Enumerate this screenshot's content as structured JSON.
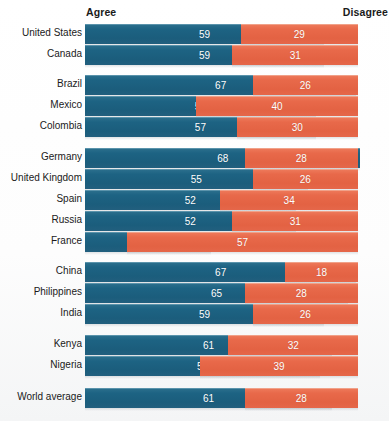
{
  "header": {
    "agree_label": "Agree",
    "disagree_label": "Disagree"
  },
  "colors": {
    "agree": "#1d6383",
    "disagree": "#e8694a",
    "background": "#ffffff",
    "label_text": "#1a1a1a",
    "value_text": "#ffffff"
  },
  "chart_data": {
    "type": "bar",
    "title": "",
    "subtitle": "",
    "xlabel": "",
    "ylabel": "",
    "orientation": "horizontal",
    "layout": "diverging-paired",
    "grid": false,
    "legend_position": "top",
    "xlim": [
      0,
      70
    ],
    "legend": [
      "Agree",
      "Disagree"
    ],
    "categories": [
      "United States",
      "Canada",
      "Brazil",
      "Mexico",
      "Colombia",
      "Germany",
      "United Kingdom",
      "Spain",
      "Russia",
      "France",
      "China",
      "Philippines",
      "India",
      "Kenya",
      "Nigeria",
      "World average"
    ],
    "series": [
      {
        "name": "Agree",
        "color": "#1d6383",
        "values": [
          59,
          59,
          67,
          57,
          57,
          68,
          55,
          52,
          52,
          31,
          67,
          65,
          59,
          61,
          58,
          61
        ]
      },
      {
        "name": "Disagree",
        "color": "#e8694a",
        "values": [
          29,
          31,
          26,
          40,
          30,
          28,
          26,
          34,
          31,
          57,
          18,
          28,
          26,
          32,
          39,
          28
        ]
      }
    ],
    "groups": [
      {
        "name": "North America",
        "rows": [
          "United States",
          "Canada"
        ]
      },
      {
        "name": "Latin America",
        "rows": [
          "Brazil",
          "Mexico",
          "Colombia"
        ]
      },
      {
        "name": "Europe",
        "rows": [
          "Germany",
          "United Kingdom",
          "Spain",
          "Russia",
          "France"
        ]
      },
      {
        "name": "Asia",
        "rows": [
          "China",
          "Philippines",
          "India"
        ]
      },
      {
        "name": "Africa",
        "rows": [
          "Kenya",
          "Nigeria"
        ]
      },
      {
        "name": "Overall",
        "rows": [
          "World average"
        ]
      }
    ]
  },
  "rows": [
    {
      "label": "United States",
      "agree": 59,
      "disagree": 29,
      "top": 24,
      "group": 0
    },
    {
      "label": "Canada",
      "agree": 59,
      "disagree": 31,
      "top": 45,
      "group": 0
    },
    {
      "label": "Brazil",
      "agree": 67,
      "disagree": 26,
      "top": 75,
      "group": 1
    },
    {
      "label": "Mexico",
      "agree": 57,
      "disagree": 40,
      "top": 96,
      "group": 1
    },
    {
      "label": "Colombia",
      "agree": 57,
      "disagree": 30,
      "top": 117,
      "group": 1
    },
    {
      "label": "Germany",
      "agree": 68,
      "disagree": 28,
      "top": 148,
      "group": 2
    },
    {
      "label": "United Kingdom",
      "agree": 55,
      "disagree": 26,
      "top": 169,
      "group": 2
    },
    {
      "label": "Spain",
      "agree": 52,
      "disagree": 34,
      "top": 190,
      "group": 2
    },
    {
      "label": "Russia",
      "agree": 52,
      "disagree": 31,
      "top": 211,
      "group": 2
    },
    {
      "label": "France",
      "agree": 31,
      "disagree": 57,
      "top": 232,
      "group": 2
    },
    {
      "label": "China",
      "agree": 67,
      "disagree": 18,
      "top": 262,
      "group": 3
    },
    {
      "label": "Philippines",
      "agree": 65,
      "disagree": 28,
      "top": 283,
      "group": 3
    },
    {
      "label": "India",
      "agree": 59,
      "disagree": 26,
      "top": 304,
      "group": 3
    },
    {
      "label": "Kenya",
      "agree": 61,
      "disagree": 32,
      "top": 335,
      "group": 4
    },
    {
      "label": "Nigeria",
      "agree": 58,
      "disagree": 39,
      "top": 356,
      "group": 4
    },
    {
      "label": "World average",
      "agree": 61,
      "disagree": 28,
      "top": 388,
      "group": 5
    }
  ],
  "scale": {
    "px_per_unit": 4.05,
    "agree_left": 85,
    "disagree_right_edge": 358
  }
}
